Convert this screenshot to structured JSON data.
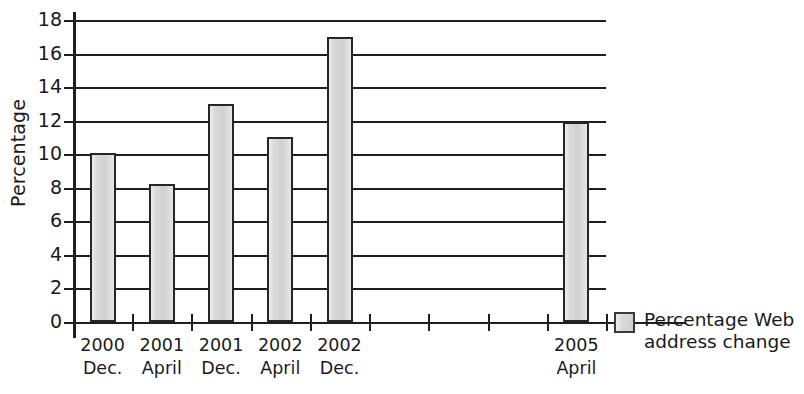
{
  "chart_data": {
    "type": "bar",
    "title": "",
    "xlabel": "",
    "ylabel": "Percentage",
    "ylim": [
      0,
      18
    ],
    "ytick_step": 2,
    "yticks": [
      0,
      2,
      4,
      6,
      8,
      10,
      12,
      14,
      16,
      18
    ],
    "grid": true,
    "legend_position": "right",
    "categories": [
      "2000 Dec.",
      "2001 April",
      "2001 Dec.",
      "2002 April",
      "2002 Dec.",
      "2005 April"
    ],
    "category_lines": [
      {
        "year": "2000",
        "month": "Dec."
      },
      {
        "year": "2001",
        "month": "April"
      },
      {
        "year": "2001",
        "month": "Dec."
      },
      {
        "year": "2002",
        "month": "April"
      },
      {
        "year": "2002",
        "month": "Dec."
      },
      {
        "year": "2005",
        "month": "April"
      }
    ],
    "slot_count": 9,
    "category_slots": [
      0,
      1,
      2,
      3,
      4,
      8
    ],
    "values": [
      10.1,
      8.2,
      13.0,
      11.0,
      17.0,
      11.9
    ],
    "series": [
      {
        "name": "Percentage Web address change",
        "values": [
          10.1,
          8.2,
          13.0,
          11.0,
          17.0,
          11.9
        ]
      }
    ],
    "bar_color": "#d9d9d9",
    "bar_border_color": "#262626",
    "axis_color": "#1f1f1f"
  },
  "legend": {
    "line1": "Percentage Web",
    "line2": "address change",
    "full_label": "Percentage Web address change"
  }
}
